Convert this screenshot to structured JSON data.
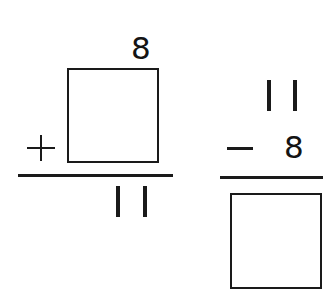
{
  "problems": [
    {
      "id": "addition",
      "operator": "+",
      "top_addend": "8",
      "missing_addend": "",
      "sum": "11"
    },
    {
      "id": "subtraction",
      "operator": "−",
      "minuend": "11",
      "subtrahend": "8",
      "missing_difference": ""
    }
  ]
}
